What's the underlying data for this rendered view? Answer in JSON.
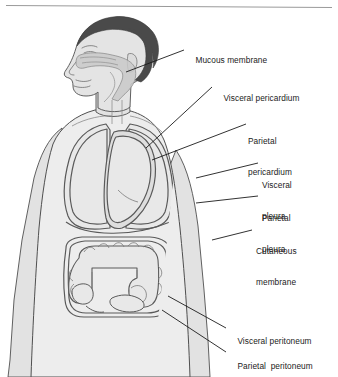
{
  "figure": {
    "rule_color": "#9a9a9a",
    "colors": {
      "background": "#ffffff",
      "skin_fill": "#e2e2e2",
      "torso_fill": "#ededed",
      "hair_fill": "#4a4a4a",
      "cavity_fill": "#c9c9c9",
      "organ_fill": "#e8e8e8",
      "outline": "#4f4f4f",
      "membrane_line": "#5a5a5a",
      "leader_line": "#1b1b1b",
      "text": "#1b1b1b"
    }
  },
  "labels": [
    {
      "id": "mucous-membrane",
      "text": "Mucous membrane",
      "lines": [
        "Mucous membrane"
      ],
      "x": 186,
      "y": 45
    },
    {
      "id": "visceral-pericardium",
      "text": "Visceral pericardium",
      "lines": [
        "Visceral pericardium"
      ],
      "x": 214,
      "y": 83
    },
    {
      "id": "parietal-pericardium",
      "text": "Parietal pericardium",
      "lines": [
        "Parietal",
        "pericardium"
      ],
      "x": 248,
      "y": 116
    },
    {
      "id": "visceral-pleura",
      "text": "Visceral pleura",
      "lines": [
        "Visceral",
        "pleura"
      ],
      "x": 262,
      "y": 160
    },
    {
      "id": "parietal-pleura",
      "text": "Parietal pleura",
      "lines": [
        "Parietal",
        "pleura"
      ],
      "x": 262,
      "y": 193
    },
    {
      "id": "cutaneous-membrane",
      "text": "Cutaneous membrane",
      "lines": [
        "Cutaneous",
        "membrane"
      ],
      "x": 256,
      "y": 226
    },
    {
      "id": "visceral-peritoneum",
      "text": "Visceral peritoneum",
      "lines": [
        "Visceral peritoneum"
      ],
      "x": 228,
      "y": 326
    },
    {
      "id": "parietal-peritoneum",
      "text": "Parietal  peritoneum",
      "lines": [
        "Parietal  peritoneum"
      ],
      "x": 228,
      "y": 351
    }
  ],
  "structures": [
    {
      "id": "head",
      "name": "head-profile"
    },
    {
      "id": "hair",
      "name": "hair"
    },
    {
      "id": "nasal-oral-cavity",
      "name": "mucous-membrane-cavity"
    },
    {
      "id": "torso",
      "name": "torso"
    },
    {
      "id": "left-arm",
      "name": "left-arm"
    },
    {
      "id": "right-arm",
      "name": "right-arm"
    },
    {
      "id": "lung-right",
      "name": "right-lung-with-pleura"
    },
    {
      "id": "lung-left",
      "name": "left-lung-with-pleura"
    },
    {
      "id": "heart",
      "name": "heart-with-pericardium"
    },
    {
      "id": "diaphragm",
      "name": "diaphragm"
    },
    {
      "id": "large-intestine",
      "name": "large-intestine-colon"
    },
    {
      "id": "peritoneum",
      "name": "peritoneal-membrane"
    }
  ]
}
